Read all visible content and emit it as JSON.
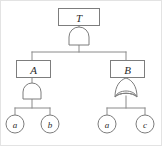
{
  "diagram": {
    "type": "fault-tree",
    "title": "",
    "colors": {
      "stroke": "#7d7d7d",
      "wire": "#8a8a8a",
      "fill": "#ffffff",
      "text": "#2b2b2b",
      "frame": "#e3e3e3"
    },
    "top_event": {
      "label": "T",
      "shape": "rectangle",
      "gate": "AND"
    },
    "intermediate_events": [
      {
        "label": "A",
        "shape": "rectangle",
        "gate": "AND",
        "children": [
          "a",
          "b"
        ]
      },
      {
        "label": "B",
        "shape": "rectangle",
        "gate": "OR",
        "children": [
          "a",
          "c"
        ]
      }
    ],
    "basic_events": [
      {
        "label": "a",
        "shape": "circle",
        "parent": "A"
      },
      {
        "label": "b",
        "shape": "circle",
        "parent": "A"
      },
      {
        "label": "a",
        "shape": "circle",
        "parent": "B"
      },
      {
        "label": "c",
        "shape": "circle",
        "parent": "B"
      }
    ],
    "gates": [
      {
        "id": "gate-top",
        "type": "AND",
        "parent": "T"
      },
      {
        "id": "gate-a",
        "type": "AND",
        "parent": "A"
      },
      {
        "id": "gate-b",
        "type": "OR",
        "parent": "B"
      }
    ]
  }
}
